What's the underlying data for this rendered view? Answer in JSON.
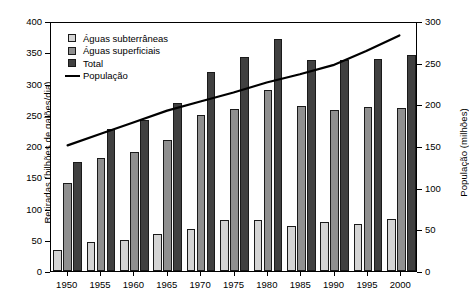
{
  "chart_data": {
    "type": "bar",
    "title": "",
    "xlabel": "",
    "ylabel": "Retiradas (bilhões de galões/dia)",
    "y2label": "População (milhões)",
    "ylim": [
      0,
      400
    ],
    "y2lim": [
      0,
      300
    ],
    "yticks": [
      0,
      50,
      100,
      150,
      200,
      250,
      300,
      350,
      400
    ],
    "y2ticks": [
      0,
      50,
      100,
      150,
      200,
      250,
      300
    ],
    "grid": false,
    "legend_position": "top-left",
    "categories": [
      "1950",
      "1955",
      "1960",
      "1965",
      "1970",
      "1975",
      "1980",
      "1985",
      "1990",
      "1995",
      "2000"
    ],
    "series": [
      {
        "name": "Águas subterrâneas",
        "type": "bar",
        "axis": "left",
        "color": "#d4d4d4",
        "values": [
          34,
          47,
          50,
          60,
          68,
          82,
          82,
          72,
          78,
          75,
          83
        ]
      },
      {
        "name": "Águas superficiais",
        "type": "bar",
        "axis": "left",
        "color": "#8f8f8f",
        "values": [
          141,
          181,
          190,
          210,
          250,
          260,
          290,
          264,
          258,
          263,
          261
        ]
      },
      {
        "name": "Total",
        "type": "bar",
        "axis": "left",
        "color": "#404040",
        "values": [
          175,
          227,
          241,
          269,
          318,
          342,
          372,
          338,
          338,
          340,
          345
        ]
      },
      {
        "name": "População",
        "type": "line",
        "axis": "right",
        "color": "#000000",
        "values": [
          152,
          166,
          180,
          194,
          205,
          216,
          228,
          238,
          249,
          266,
          285
        ]
      }
    ]
  },
  "legend": {
    "items": [
      {
        "label": "Águas subterrâneas",
        "marker": "swatch-ground"
      },
      {
        "label": "Águas superficiais",
        "marker": "swatch-surface"
      },
      {
        "label": "Total",
        "marker": "swatch-total"
      },
      {
        "label": "População",
        "marker": "line-black"
      }
    ]
  }
}
